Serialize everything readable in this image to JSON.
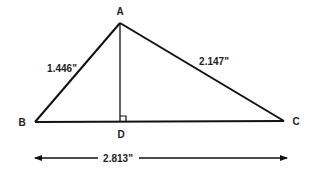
{
  "diagram": {
    "type": "right-triangle-with-altitude",
    "vertices": {
      "A": {
        "label": "A",
        "x": 120,
        "y": 23
      },
      "B": {
        "label": "B",
        "x": 35,
        "y": 122
      },
      "C": {
        "label": "C",
        "x": 284,
        "y": 121
      },
      "D": {
        "label": "D",
        "x": 121,
        "y": 122
      }
    },
    "measurements": {
      "AB": "1.446\"",
      "AC": "2.147\"",
      "BC": "2.813\""
    },
    "right_angle_at": "D",
    "colors": {
      "stroke": "#111111",
      "text": "#222222",
      "background": "#ffffff"
    }
  }
}
